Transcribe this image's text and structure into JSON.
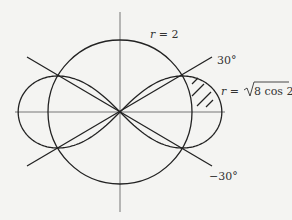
{
  "diagram": {
    "type": "polar-graph",
    "curves": [
      {
        "name": "circle",
        "equation": "r = 2",
        "label": "r = 2"
      },
      {
        "name": "lemniscate",
        "equation": "r = √(8 cos 2θ)",
        "label_prefix": "r = ",
        "label_radicand": "8 cos 2θ"
      }
    ],
    "lines": [
      {
        "name": "line-30",
        "angle_label": "30°"
      },
      {
        "name": "line-neg30",
        "angle_label": "−30°"
      }
    ],
    "shaded_region": "Region inside lemniscate and outside circle, right loop, above polar axis"
  },
  "labels": {
    "circle": "r = 2",
    "angle_pos": "30°",
    "angle_neg": "−30°",
    "lemniscate_prefix": "r = ",
    "lemniscate_radicand": "8 cos 2θ"
  },
  "colors": {
    "stroke": "#222222",
    "axis": "#777777",
    "background": "#f4f4f2"
  }
}
